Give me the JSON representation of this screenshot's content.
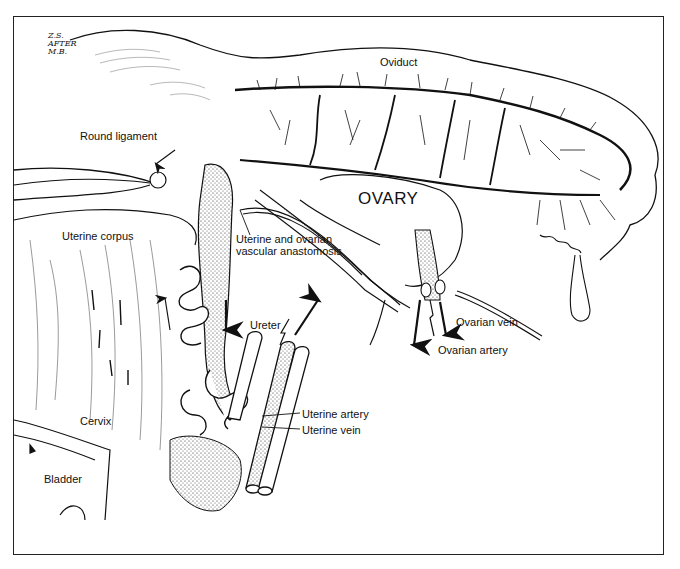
{
  "figure": {
    "signature": [
      "Z.S.",
      "AFTER",
      "M.B."
    ],
    "labels": {
      "oviduct": "Oviduct",
      "round_ligament": "Round ligament",
      "ovary": "OVARY",
      "uterine_corpus": "Uterine corpus",
      "anastomosis_line1": "Uterine and ovarian",
      "anastomosis_line2": "vascular anastomosis",
      "ureter": "Ureter",
      "ovarian_vein": "Ovarian vein",
      "ovarian_artery": "Ovarian artery",
      "uterine_artery": "Uterine artery",
      "uterine_vein": "Uterine vein",
      "cervix": "Cervix",
      "bladder": "Bladder"
    },
    "colors": {
      "ink": "#111111",
      "background": "#ffffff",
      "frame": "#222222"
    }
  }
}
